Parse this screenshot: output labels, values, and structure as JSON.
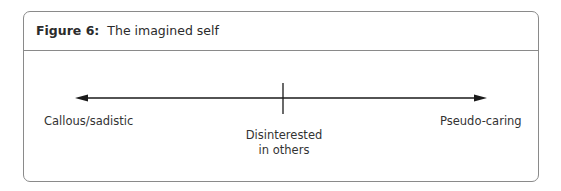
{
  "figure": {
    "label": "Figure 6:",
    "title": "The imagined self"
  },
  "axis": {
    "left_label": "Callous/sadistic",
    "middle_label_line1": "Disinterested",
    "middle_label_line2": "in others",
    "right_label": "Pseudo-caring",
    "line_color": "#1a1a1a",
    "arrows": "both"
  }
}
